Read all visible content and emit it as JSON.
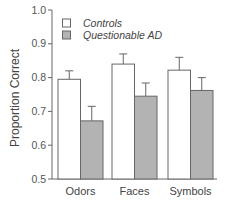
{
  "chart_data": {
    "type": "bar",
    "title": "",
    "xlabel": "",
    "ylabel": "Proportion Correct",
    "ylim": [
      0.5,
      1.0
    ],
    "yticks": [
      "0.5",
      "0.6",
      "0.7",
      "0.8",
      "0.9",
      "1.0"
    ],
    "grid": false,
    "legend_position": "top-left inside",
    "categories": [
      "Odors",
      "Faces",
      "Symbols"
    ],
    "series": [
      {
        "name": "Controls",
        "color": "#ffffff",
        "values": [
          0.795,
          0.84,
          0.822
        ],
        "error_upper": [
          0.82,
          0.87,
          0.86
        ]
      },
      {
        "name": "Questionable AD",
        "color": "#b3b3b3",
        "values": [
          0.672,
          0.745,
          0.762
        ],
        "error_upper": [
          0.715,
          0.784,
          0.8
        ]
      }
    ]
  }
}
